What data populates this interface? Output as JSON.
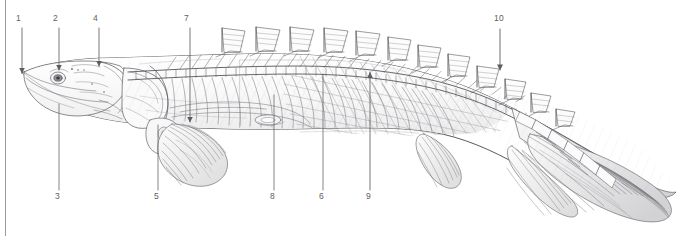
{
  "plate": {
    "title": "Bichir (Polypterus) anatomical plate",
    "subject": "elongate ray-finned fish, lateral view, skeleton and musculature with dorsal finlets",
    "background_color": "#ffffff",
    "ink_color": "#5e5e62",
    "label_color": "#5e5e62",
    "frame_rule_color": "#9a9aa0",
    "width": 696,
    "height": 236
  },
  "callouts": [
    {
      "id": "1",
      "label": "1",
      "label_x": 20,
      "label_y": 18,
      "line_x": 22,
      "line_y1": 28,
      "line_y2": 73,
      "arrow": "down",
      "side": "top"
    },
    {
      "id": "2",
      "label": "2",
      "label_x": 57,
      "label_y": 18,
      "line_x": 59,
      "line_y1": 28,
      "line_y2": 70,
      "arrow": "down",
      "side": "top"
    },
    {
      "id": "4",
      "label": "4",
      "label_x": 97,
      "label_y": 18,
      "line_x": 99,
      "line_y1": 28,
      "line_y2": 66,
      "arrow": "down",
      "side": "top"
    },
    {
      "id": "7",
      "label": "7",
      "label_x": 188,
      "label_y": 18,
      "line_x": 190,
      "line_y1": 28,
      "line_y2": 122,
      "arrow": "down",
      "side": "top"
    },
    {
      "id": "10",
      "label": "10",
      "label_x": 494,
      "label_y": 18,
      "line_x": 500,
      "line_y1": 29,
      "line_y2": 70,
      "arrow": "down",
      "side": "top"
    },
    {
      "id": "3",
      "label": "3",
      "label_x": 57,
      "label_y": 194,
      "line_x": 59,
      "line_y1": 104,
      "line_y2": 190,
      "arrow": "none",
      "side": "bottom"
    },
    {
      "id": "5",
      "label": "5",
      "label_x": 156,
      "label_y": 194,
      "line_x": 158,
      "line_y1": 125,
      "line_y2": 190,
      "arrow": "none",
      "side": "bottom"
    },
    {
      "id": "8",
      "label": "8",
      "label_x": 272,
      "label_y": 194,
      "line_x": 274,
      "line_y1": 95,
      "line_y2": 190,
      "arrow": "none",
      "side": "bottom"
    },
    {
      "id": "6",
      "label": "6",
      "label_x": 321,
      "label_y": 194,
      "line_x": 323,
      "line_y1": 74,
      "line_y2": 190,
      "arrow": "none",
      "side": "bottom"
    },
    {
      "id": "9",
      "label": "9",
      "label_x": 368,
      "label_y": 194,
      "line_x": 370,
      "line_y1": 72,
      "line_y2": 190,
      "arrow": "up",
      "side": "bottom"
    }
  ]
}
